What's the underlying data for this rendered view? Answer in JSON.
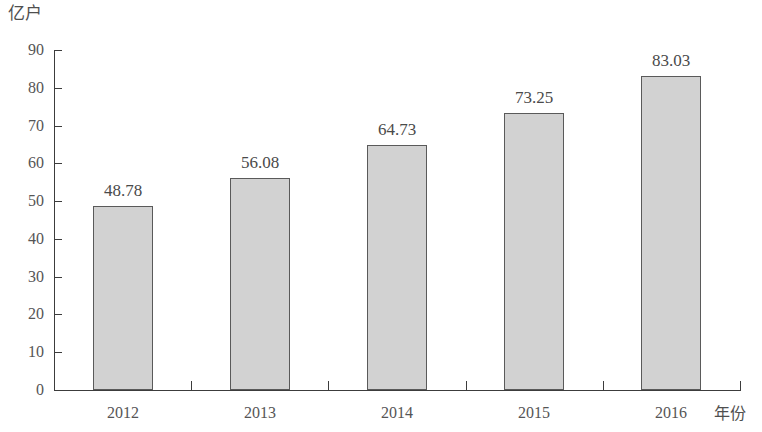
{
  "chart_data": {
    "type": "bar",
    "title": "",
    "xlabel": "年份",
    "ylabel": "亿户",
    "categories": [
      "2012",
      "2013",
      "2014",
      "2015",
      "2016"
    ],
    "values": [
      48.78,
      56.08,
      64.73,
      73.25,
      83.03
    ],
    "value_labels": [
      "48.78",
      "56.08",
      "64.73",
      "73.25",
      "83.03"
    ],
    "ylim": [
      0,
      90
    ],
    "ytick_values": [
      0,
      10,
      20,
      30,
      40,
      50,
      60,
      70,
      80,
      90
    ],
    "ytick_labels": [
      "0",
      "10",
      "20",
      "30",
      "40",
      "50",
      "60",
      "70",
      "80",
      "90"
    ],
    "grid": false,
    "legend": null,
    "bar_color": "#d2d2d2",
    "bar_border_color": "#5a5a5a",
    "axis_color": "#3c3c3c",
    "background": "#ffffff"
  }
}
